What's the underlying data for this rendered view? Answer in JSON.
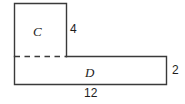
{
  "figure": {
    "type": "composite-rectilinear-shape",
    "background_color": "#ffffff",
    "stroke_color": "#3a3a3a",
    "label_color": "#1d1d1d",
    "regions": [
      {
        "id": "c",
        "label": "C",
        "position": "upper-left",
        "x": 14,
        "y": 3,
        "width": 52,
        "height": 53
      },
      {
        "id": "d",
        "label": "D",
        "position": "bottom-full-width",
        "x": 14,
        "y": 56,
        "width": 152,
        "height": 29
      }
    ],
    "dimensions": [
      {
        "id": "height-c",
        "value": "4",
        "side": "right-of-upper-rectangle",
        "measures": "height of region C"
      },
      {
        "id": "height-d",
        "value": "2",
        "side": "right-of-lower-rectangle",
        "measures": "height of region D"
      },
      {
        "id": "width-total",
        "value": "12",
        "side": "below-lower-rectangle",
        "measures": "total bottom width"
      }
    ],
    "divider": {
      "id": "interior-divider",
      "style": "dashed",
      "orientation": "horizontal",
      "from_x": 14,
      "to_x": 66,
      "y": 56,
      "description": "dashed line separating region C from region D"
    }
  }
}
